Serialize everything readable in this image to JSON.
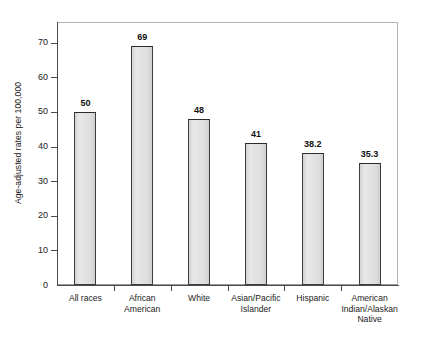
{
  "chart_data": {
    "type": "bar",
    "title": "",
    "xlabel": "",
    "ylabel": "Age-adjusted rates per 100,000",
    "ylim": [
      0,
      76
    ],
    "yticks": [
      0,
      10,
      20,
      30,
      40,
      50,
      60,
      70
    ],
    "ytick_labels": [
      "0",
      "10",
      "20",
      "30",
      "40",
      "50",
      "60",
      "70"
    ],
    "grid": false,
    "legend": null,
    "categories": [
      "All races",
      "African American",
      "White",
      "Asian/Pacific Islander",
      "Hispanic",
      "American Indian/Alaskan Native"
    ],
    "category_lines": [
      [
        "All races"
      ],
      [
        "African",
        "American"
      ],
      [
        "White"
      ],
      [
        "Asian/Pacific",
        "Islander"
      ],
      [
        "Hispanic"
      ],
      [
        "American",
        "Indian/Alaskan",
        "Native"
      ]
    ],
    "values": [
      50,
      69,
      48,
      41,
      38.2,
      35.3
    ],
    "value_labels": [
      "50",
      "69",
      "48",
      "41",
      "38.2",
      "35.3"
    ],
    "colors": {
      "bar_fill": "#e2e2e2",
      "bar_edge": "#3c3c3c",
      "axis": "#4a4a4a",
      "frame": "#b4b4b4",
      "text": "#1a1a1a",
      "background": "#ffffff"
    }
  }
}
